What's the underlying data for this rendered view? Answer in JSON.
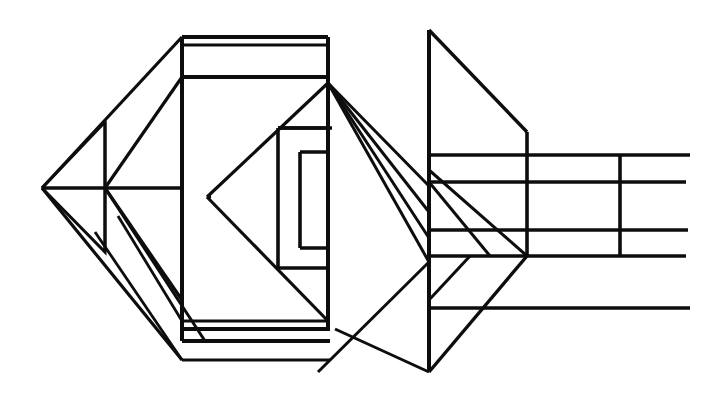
{
  "document": {
    "title": "Technical Wireframe Line Drawing",
    "kind": "scanned-line-art",
    "width": 718,
    "height": 413,
    "background_color": "#ffffff",
    "ink_color": "#0d0d0d",
    "description": "Monochrome engineering-style perspective wireframe: a central rectangular box with nested inner rectangles, a left pyramidal vertex fan, and a right-hand trapezoidal plate with horizontal extension lines."
  },
  "style": {
    "stroke_color": "#0d0d0d",
    "stroke_width_thick": 4,
    "stroke_width_medium": 3.2,
    "stroke_width_thin": 2.6,
    "fill": "none"
  },
  "figure": {
    "groups": [
      {
        "name": "central-box-outer",
        "label": "Central rectangular box outline",
        "paths": [
          {
            "name": "box-top-outer-edge",
            "d": "M182,37 L328,37",
            "w": 4
          },
          {
            "name": "box-top-inner-edge",
            "d": "M182,45 L328,45",
            "w": 3.2
          },
          {
            "name": "box-left-outer-edge",
            "d": "M182,37 L182,341",
            "w": 4
          },
          {
            "name": "box-right-outer-edge",
            "d": "M328,37 L328,329",
            "w": 4
          },
          {
            "name": "box-upper-divider",
            "d": "M182,77 L328,77",
            "w": 4
          },
          {
            "name": "box-lower-divider-a",
            "d": "M182,321 L328,321",
            "w": 3.2
          },
          {
            "name": "box-lower-divider-b",
            "d": "M182,329 L330,329",
            "w": 4
          },
          {
            "name": "box-bottom-edge",
            "d": "M182,341 L330,341",
            "w": 4
          },
          {
            "name": "box-base-shadow-line",
            "d": "M182,360 L330,360",
            "w": 3.2
          }
        ]
      },
      {
        "name": "central-box-inner-nested",
        "label": "Nested inner rectangles inside the box",
        "paths": [
          {
            "name": "inner-rect-outer",
            "d": "M278,128 L328,128 M278,128 L278,268 M278,268 L328,268",
            "w": 3.6
          },
          {
            "name": "inner-rect-inner",
            "d": "M300,152 L328,152 M300,152 L300,248 M300,248 L328,248",
            "w": 3.6
          },
          {
            "name": "inner-rect-outer-top-return",
            "d": "M278,128 L332,128",
            "w": 3.6
          }
        ]
      },
      {
        "name": "left-vertex-fan",
        "label": "Left pyramid apex and converging diagonals",
        "paths": [
          {
            "name": "apex-horizontal-axis",
            "d": "M42,188 L182,188",
            "w": 3.6
          },
          {
            "name": "apex-upper-diagonal-to-box-top",
            "d": "M42,188 L182,37",
            "w": 3.2
          },
          {
            "name": "apex-lower-diagonal-to-box-bottom",
            "d": "M42,188 L182,360",
            "w": 3.2
          },
          {
            "name": "left-small-diamond-upper",
            "d": "M42,188 L105,122 L105,188",
            "w": 3.0
          },
          {
            "name": "left-small-diamond-lower",
            "d": "M42,188 L105,252 L105,188",
            "w": 3.0
          },
          {
            "name": "mid-vertical-strut",
            "d": "M105,122 L105,252",
            "w": 3.0
          },
          {
            "name": "diagonal-box-upper-to-mid",
            "d": "M182,77 L105,188",
            "w": 3.2
          },
          {
            "name": "diagonal-mid-to-box-down",
            "d": "M105,188 L182,300",
            "w": 3.2
          },
          {
            "name": "diagonal-apex-node-down-right",
            "d": "M105,188 L205,341",
            "w": 3.0
          },
          {
            "name": "diagonal-inner-to-lower",
            "d": "M118,216 L182,321",
            "w": 2.8
          },
          {
            "name": "left-lower-wing",
            "d": "M95,232 L182,360",
            "w": 2.8
          }
        ]
      },
      {
        "name": "box-interior-diagonals",
        "label": "Diagonal lines crossing the box interior",
        "paths": [
          {
            "name": "interior-triangle-upper",
            "d": "M207,197 L328,83",
            "w": 3.2
          },
          {
            "name": "interior-triangle-lower",
            "d": "M207,197 L328,321",
            "w": 3.2
          },
          {
            "name": "interior-left-vertex-marker",
            "d": "M207,197 L211,197",
            "w": 3.2
          }
        ]
      },
      {
        "name": "right-fan-from-box-corner",
        "label": "Fan of diagonals radiating right from the box top-right corner",
        "paths": [
          {
            "name": "fan-line-1",
            "d": "M328,83 L429,186",
            "w": 3.0
          },
          {
            "name": "fan-line-2",
            "d": "M328,83 L429,212",
            "w": 3.0
          },
          {
            "name": "fan-line-3",
            "d": "M328,83 L429,238",
            "w": 3.0
          },
          {
            "name": "fan-line-4",
            "d": "M328,83 L429,262",
            "w": 3.0
          },
          {
            "name": "fan-line-5",
            "d": "M335,329 L429,372",
            "w": 3.0
          },
          {
            "name": "fan-line-6",
            "d": "M318,372 L429,262",
            "w": 3.0
          }
        ]
      },
      {
        "name": "right-trapezoid-plate",
        "label": "Right-hand trapezoidal plate",
        "paths": [
          {
            "name": "plate-vertical-edge",
            "d": "M429,30 L429,372",
            "w": 4
          },
          {
            "name": "plate-upper-diagonal",
            "d": "M429,30 L527,132",
            "w": 3.4
          },
          {
            "name": "plate-right-vertical-short",
            "d": "M527,132 L527,256",
            "w": 3.6
          },
          {
            "name": "plate-lower-diagonal",
            "d": "M429,372 L527,256",
            "w": 3.4
          },
          {
            "name": "plate-inner-diagonal-a",
            "d": "M429,170 L527,256",
            "w": 3.0
          },
          {
            "name": "plate-inner-diagonal-b",
            "d": "M429,182 L490,256",
            "w": 3.0
          },
          {
            "name": "plate-inner-diagonal-c",
            "d": "M429,300 L470,256",
            "w": 3.0
          }
        ]
      },
      {
        "name": "right-extension-lines",
        "label": "Horizontal extension / projection lines at right",
        "paths": [
          {
            "name": "extension-line-top",
            "d": "M429,155 L690,155",
            "w": 3.6
          },
          {
            "name": "extension-line-second",
            "d": "M429,182 L686,182",
            "w": 3.6
          },
          {
            "name": "extension-line-third",
            "d": "M429,230 L688,230",
            "w": 3.6
          },
          {
            "name": "extension-line-fourth",
            "d": "M429,256 L686,256",
            "w": 3.6
          },
          {
            "name": "extension-line-bottom",
            "d": "M429,308 L690,308",
            "w": 3.6
          },
          {
            "name": "extension-vertical-tie",
            "d": "M620,155 L620,256",
            "w": 3.6
          }
        ]
      }
    ]
  }
}
